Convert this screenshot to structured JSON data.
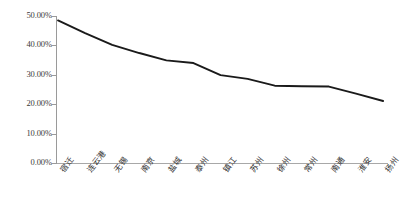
{
  "chart_data": {
    "type": "line",
    "title": "",
    "subtitle": "",
    "xlabel": "",
    "ylabel": "",
    "categories": [
      "宿迁",
      "连云港",
      "无锡",
      "南京",
      "盐城",
      "泰州",
      "镇江",
      "苏州",
      "徐州",
      "常州",
      "南通",
      "淮安",
      "扬州"
    ],
    "values": [
      48.5,
      44.2,
      40.2,
      37.4,
      34.9,
      34.0,
      29.9,
      28.6,
      26.3,
      26.1,
      26.0,
      23.6,
      21.1
    ],
    "series": [
      {
        "name": "",
        "values": [
          48.5,
          44.2,
          40.2,
          37.4,
          34.9,
          34.0,
          29.9,
          28.6,
          26.3,
          26.1,
          26.0,
          23.6,
          21.1
        ]
      }
    ],
    "ylim": [
      0,
      50
    ],
    "ytick_values": [
      0,
      10,
      20,
      30,
      40,
      50
    ],
    "ytick_labels": [
      "0.00%",
      "10.00%",
      "20.00%",
      "30.00%",
      "40.00%",
      "50.00%"
    ],
    "grid": false,
    "legend": false,
    "legend_position": "none",
    "line_color": "#1a1a1a",
    "axis_color": "#9a9a9a",
    "background_color": "#ffffff",
    "markers": false,
    "value_format": "percent"
  }
}
